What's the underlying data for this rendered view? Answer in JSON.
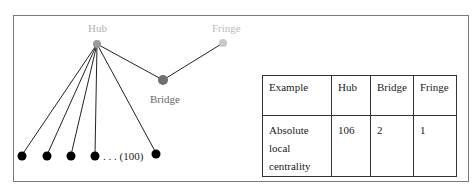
{
  "diagram": {
    "nodes": {
      "hub": {
        "label": "Hub",
        "color": "#9a9a9a"
      },
      "bridge": {
        "label": "Bridge",
        "color": "#6f6f6f"
      },
      "fringe": {
        "label": "Fringe",
        "color": "#c8c8c8"
      },
      "leaf_color": "#000000"
    },
    "leaf_count_label": ". . . (100)"
  },
  "table": {
    "headers": [
      "Example",
      "Hub",
      "Bridge",
      "Fringe"
    ],
    "rows": [
      {
        "label_lines": [
          "Absolute",
          "local",
          "centrality"
        ],
        "values": [
          "106",
          "2",
          "1"
        ]
      }
    ]
  }
}
